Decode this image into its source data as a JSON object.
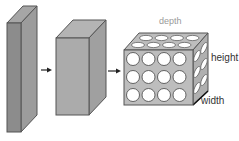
{
  "diagram": {
    "labels": {
      "depth": "depth",
      "height": "height",
      "width": "width"
    },
    "colors": {
      "slab_front": "#8c8c8c",
      "slab_side": "#9c9c9c",
      "slab_top": "#a6a6a6",
      "block_front": "#ababab",
      "block_side": "#a0a0a0",
      "block_top": "#b4b4b4",
      "cube_face": "#bdbdbd",
      "outline": "#555555",
      "label": "#333333",
      "depth_label": "#9a9a9a",
      "arrow": "#222222"
    },
    "grid": {
      "rows": 3,
      "cols": 4
    }
  }
}
